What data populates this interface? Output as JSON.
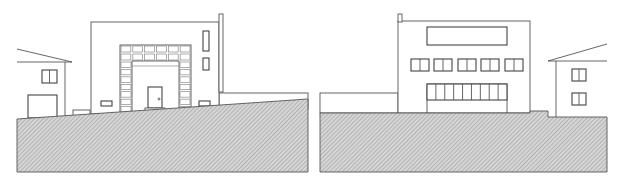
{
  "drawing": {
    "type": "architectural-elevation",
    "colors": {
      "line": "#555555",
      "hatch_bg": "#d6d6d6",
      "hatch_line": "#9a9a9a",
      "paper": "#ffffff"
    },
    "panels": [
      {
        "name": "left-elevation",
        "ground_polygon": "17,119 308,99 308,172 17,172",
        "neighbor_house": {
          "roof": "17,49 72,62",
          "eave": "17,62 72,62",
          "wall": "65,62 65,118",
          "window": {
            "x": 42,
            "y": 70,
            "w": 15,
            "h": 13,
            "mullions": 1
          },
          "garage": {
            "x": 28,
            "y": 95,
            "w": 29,
            "h": 23
          }
        },
        "main_building": {
          "x": 91,
          "y": 22,
          "w": 128,
          "h": 92,
          "chimney": {
            "x": 219,
            "y": 14,
            "w": 4,
            "h": 78
          },
          "tall_windows": [
            {
              "x": 203,
              "y": 31,
              "w": 6,
              "h": 20
            },
            {
              "x": 203,
              "y": 58,
              "w": 6,
              "h": 12
            }
          ],
          "arch_frame": {
            "x": 120,
            "y": 45,
            "w": 71,
            "h": 68,
            "top_cols": 6,
            "top_rows": 2,
            "side_rows": 9,
            "inner": {
              "x": 132,
              "y": 61,
              "w": 47,
              "h": 52
            }
          },
          "door": {
            "x": 148,
            "y": 87,
            "w": 14,
            "h": 21,
            "step": {
              "x": 145,
              "y": 108,
              "w": 20,
              "h": 5
            }
          },
          "small_windows": [
            {
              "x": 101,
              "y": 101,
              "w": 11,
              "h": 5
            },
            {
              "x": 199,
              "y": 101,
              "w": 11,
              "h": 5
            }
          ],
          "side_steps": {
            "x": 73,
            "y": 110,
            "w": 17,
            "h": 7
          }
        },
        "garden_wall": {
          "x": 219,
          "y": 93,
          "w": 89,
          "h": 16
        }
      },
      {
        "name": "right-elevation",
        "ground_polygon": "320,113 530,113 530,111 548,111 548,117 607,117 607,172 320,172",
        "garden_wall": {
          "x": 320,
          "y": 93,
          "w": 78,
          "h": 20
        },
        "main_building": {
          "x": 398,
          "y": 21,
          "w": 132,
          "h": 92,
          "chimney": {
            "x": 398,
            "y": 14,
            "w": 4,
            "h": 8
          },
          "ribbon_window": {
            "x": 427,
            "y": 27,
            "w": 80,
            "h": 18
          },
          "windows_row": [
            {
              "x": 411,
              "y": 59,
              "w": 18,
              "h": 12
            },
            {
              "x": 434,
              "y": 59,
              "w": 18,
              "h": 12
            },
            {
              "x": 458,
              "y": 59,
              "w": 18,
              "h": 12
            },
            {
              "x": 481,
              "y": 59,
              "w": 18,
              "h": 12
            },
            {
              "x": 505,
              "y": 59,
              "w": 18,
              "h": 12
            }
          ],
          "garage_door": {
            "x": 427,
            "y": 84,
            "w": 80,
            "h": 29,
            "band_h": 16,
            "panels": 9
          }
        },
        "neighbor_house": {
          "roof": "548,61 607,44",
          "eave": "548,61 607,61",
          "wall": "556,61 556,117",
          "windows": [
            {
              "x": 572,
              "y": 69,
              "w": 14,
              "h": 12
            },
            {
              "x": 572,
              "y": 93,
              "w": 14,
              "h": 12
            }
          ]
        }
      }
    ]
  }
}
